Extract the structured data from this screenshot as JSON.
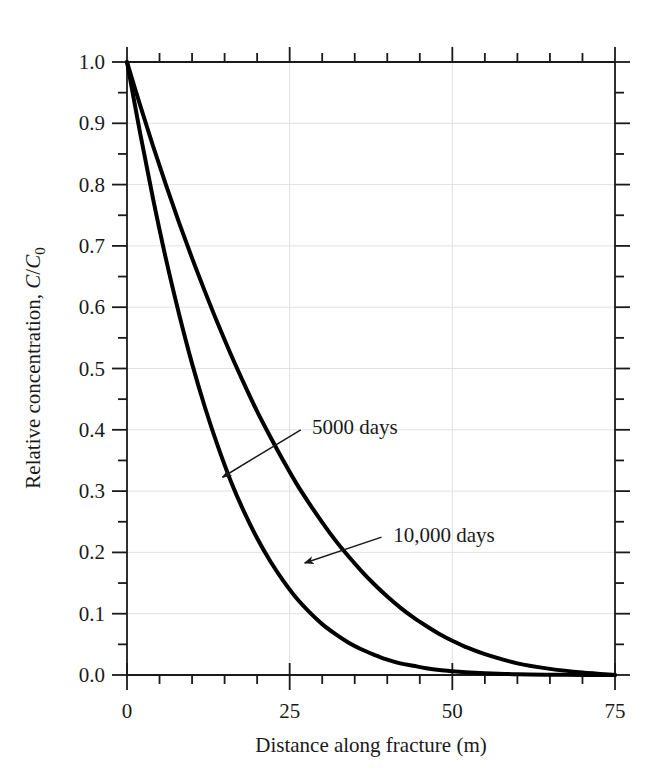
{
  "figure": {
    "background_color": "#ffffff",
    "foreground_color": "#1a1a1a",
    "gridline_color": "#e2e2e2"
  },
  "axes": {
    "x_title": "Distance along fracture (m)",
    "y_title_prefix": "Relative concentration, ",
    "y_title_numerator": "C",
    "y_title_separator": "/",
    "y_title_denominator": "C",
    "y_title_subscript": "0",
    "x_tick_labels": [
      "0",
      "25",
      "50",
      "75"
    ],
    "y_tick_labels": [
      "0.0",
      "0.1",
      "0.2",
      "0.3",
      "0.4",
      "0.5",
      "0.6",
      "0.7",
      "0.8",
      "0.9",
      "1.0"
    ]
  },
  "annotations": [
    {
      "id": "annot-5000",
      "label": "5000 days"
    },
    {
      "id": "annot-10000",
      "label": "10,000 days"
    }
  ],
  "chart_data": {
    "type": "line",
    "title": "",
    "xlabel": "Distance along fracture (m)",
    "ylabel": "Relative concentration, C/C0",
    "xlim": [
      0,
      75
    ],
    "ylim": [
      0.0,
      1.0
    ],
    "x_major_ticks": [
      0,
      25,
      50,
      75
    ],
    "x_minor_tick_step": 5,
    "y_major_ticks": [
      0.0,
      0.1,
      0.2,
      0.3,
      0.4,
      0.5,
      0.6,
      0.7,
      0.8,
      0.9,
      1.0
    ],
    "y_minor_tick_step": 0.05,
    "grid": true,
    "grid_color": "#e2e2e2",
    "legend": "none",
    "line_color": "#000000",
    "line_width": 4,
    "x": [
      0,
      2,
      4,
      6,
      8,
      10,
      12,
      14,
      16,
      18,
      20,
      22,
      24,
      26,
      28,
      30,
      32,
      34,
      36,
      38,
      40,
      42,
      44,
      46,
      48,
      50,
      52,
      55,
      60,
      65,
      70,
      75
    ],
    "series": [
      {
        "name": "5000 days",
        "annotation_label": "5000 days",
        "annotation_point": {
          "x": 13.5,
          "y": 0.315
        },
        "annotation_text_pos": {
          "x": 27.5,
          "y": 0.405
        },
        "values": [
          1.0,
          0.885,
          0.777,
          0.678,
          0.589,
          0.508,
          0.436,
          0.372,
          0.315,
          0.266,
          0.223,
          0.186,
          0.154,
          0.126,
          0.103,
          0.083,
          0.067,
          0.053,
          0.042,
          0.033,
          0.025,
          0.019,
          0.015,
          0.011,
          0.008,
          0.006,
          0.0045,
          0.003,
          0.0012,
          0.0005,
          0.0002,
          0.0
        ]
      },
      {
        "name": "10,000 days",
        "annotation_label": "10,000 days",
        "annotation_point": {
          "x": 26.0,
          "y": 0.178
        },
        "annotation_text_pos": {
          "x": 40.0,
          "y": 0.228
        },
        "values": [
          1.0,
          0.93,
          0.863,
          0.799,
          0.738,
          0.68,
          0.625,
          0.572,
          0.522,
          0.475,
          0.43,
          0.389,
          0.35,
          0.313,
          0.28,
          0.249,
          0.22,
          0.194,
          0.17,
          0.148,
          0.128,
          0.11,
          0.094,
          0.08,
          0.067,
          0.056,
          0.046,
          0.034,
          0.019,
          0.01,
          0.004,
          0.0
        ]
      }
    ]
  }
}
